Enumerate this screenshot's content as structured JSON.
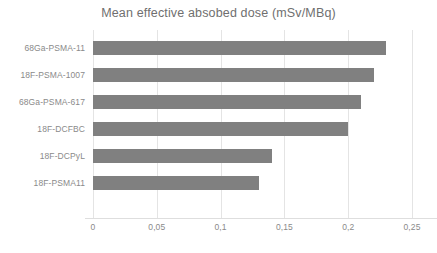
{
  "chart_data": {
    "type": "bar",
    "orientation": "horizontal",
    "title": "Mean effective absobed dose (mSv/MBq)",
    "xlabel": "",
    "ylabel": "",
    "categories": [
      "68Ga-PSMA-11",
      "18F-PSMA-1007",
      "68Ga-PSMA-617",
      "18F-DCFBC",
      "18F-DCPyL",
      "18F-PSMA11"
    ],
    "values": [
      0.23,
      0.22,
      0.21,
      0.2,
      0.14,
      0.13
    ],
    "xlim": [
      0,
      0.25
    ],
    "xticks": [
      0,
      0.05,
      0.1,
      0.15,
      0.2,
      0.25
    ],
    "xtick_labels": [
      "0",
      "0,05",
      "0,1",
      "0,15",
      "0,2",
      "0,25"
    ],
    "grid": true,
    "grid_axis": "x",
    "legend": false,
    "bar_color": "#808080",
    "grid_color": "#e4e4e4",
    "text_color": "#8a8a8a",
    "title_color": "#6f6f6f",
    "background_color": "#ffffff"
  }
}
